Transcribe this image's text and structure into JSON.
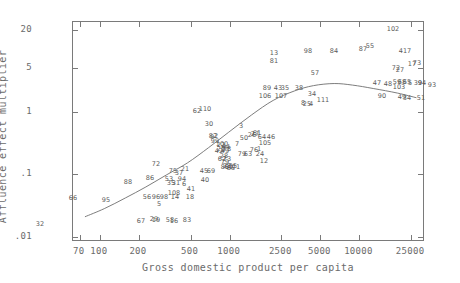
{
  "axes": {
    "x_title": "Gross domestic product per capita",
    "y_title": "Affluence effect multiplier",
    "x_ticks": [
      {
        "label": "70",
        "value": 70
      },
      {
        "label": "100",
        "value": 100
      },
      {
        "label": "200",
        "value": 200
      },
      {
        "label": "500",
        "value": 500
      },
      {
        "label": "1000",
        "value": 1000
      },
      {
        "label": "2500",
        "value": 2500
      },
      {
        "label": "5000",
        "value": 5000
      },
      {
        "label": "10000",
        "value": 10000
      },
      {
        "label": "25000",
        "value": 25000
      }
    ],
    "y_ticks": [
      {
        "label": "20",
        "value": 20
      },
      {
        "label": "5",
        "value": 5
      },
      {
        "label": "1",
        "value": 1
      },
      {
        "label": ".1",
        "value": 0.1
      },
      {
        "label": ".01",
        "value": 0.01
      }
    ]
  },
  "chart_data": {
    "type": "scatter",
    "title": "",
    "xlabel": "Gross domestic product per capita",
    "ylabel": "Affluence effect multiplier",
    "xscale": "log",
    "yscale": "log",
    "xlim": [
      62,
      32000
    ],
    "ylim": [
      0.0082,
      27
    ],
    "grid": false,
    "legend": null,
    "point_label_mode": "numeric-id",
    "annotations": [
      {
        "label": "fitted-curve",
        "type": "smooth-trend-line"
      }
    ],
    "points": [
      {
        "label": "32",
        "x": 112,
        "y": 0.0245
      },
      {
        "label": "66",
        "x": 88,
        "y": 0.041
      },
      {
        "label": "95",
        "x": 130,
        "y": 0.039
      },
      {
        "label": "67",
        "x": 196,
        "y": 0.0265
      },
      {
        "label": "56",
        "x": 212,
        "y": 0.0455
      },
      {
        "label": "96",
        "x": 222,
        "y": 0.0455
      },
      {
        "label": "98",
        "x": 232,
        "y": 0.0455
      },
      {
        "label": "5",
        "x": 228,
        "y": 0.0395
      },
      {
        "label": "19",
        "x": 222,
        "y": 0.0272
      },
      {
        "label": "29",
        "x": 218,
        "y": 0.0277
      },
      {
        "label": "88",
        "x": 268,
        "y": 0.088
      },
      {
        "label": "108",
        "x": 318,
        "y": 0.057
      },
      {
        "label": "14",
        "x": 320,
        "y": 0.0455
      },
      {
        "label": "18",
        "x": 360,
        "y": 0.0455
      },
      {
        "label": "58",
        "x": 314,
        "y": 0.0268
      },
      {
        "label": "16",
        "x": 322,
        "y": 0.0262
      },
      {
        "label": "83",
        "x": 352,
        "y": 0.0278
      },
      {
        "label": "86",
        "x": 310,
        "y": 0.105
      },
      {
        "label": "53",
        "x": 356,
        "y": 0.1
      },
      {
        "label": "35",
        "x": 364,
        "y": 0.086
      },
      {
        "label": "31",
        "x": 372,
        "y": 0.086
      },
      {
        "label": "94",
        "x": 388,
        "y": 0.1
      },
      {
        "label": "6",
        "x": 392,
        "y": 0.082
      },
      {
        "label": "41",
        "x": 404,
        "y": 0.068
      },
      {
        "label": "40",
        "x": 452,
        "y": 0.098
      },
      {
        "label": "75",
        "x": 368,
        "y": 0.13
      },
      {
        "label": "37",
        "x": 384,
        "y": 0.122
      },
      {
        "label": "21",
        "x": 404,
        "y": 0.138
      },
      {
        "label": "72",
        "x": 318,
        "y": 0.165
      },
      {
        "label": "45",
        "x": 472,
        "y": 0.128
      },
      {
        "label": "69",
        "x": 492,
        "y": 0.127
      },
      {
        "label": "89",
        "x": 560,
        "y": 0.146
      },
      {
        "label": "60",
        "x": 574,
        "y": 0.146
      },
      {
        "label": "23",
        "x": 568,
        "y": 0.15
      },
      {
        "label": "55",
        "x": 600,
        "y": 0.15
      },
      {
        "label": "71",
        "x": 612,
        "y": 0.146
      },
      {
        "label": "85",
        "x": 588,
        "y": 0.144
      },
      {
        "label": "28",
        "x": 556,
        "y": 0.213
      },
      {
        "label": "62",
        "x": 548,
        "y": 0.198
      },
      {
        "label": "73",
        "x": 566,
        "y": 0.196
      },
      {
        "label": "79",
        "x": 558,
        "y": 0.178
      },
      {
        "label": "20",
        "x": 540,
        "y": 0.268
      },
      {
        "label": "78",
        "x": 564,
        "y": 0.268
      },
      {
        "label": "42",
        "x": 534,
        "y": 0.254
      },
      {
        "label": "49",
        "x": 552,
        "y": 0.252
      },
      {
        "label": "99",
        "x": 512,
        "y": 0.348
      },
      {
        "label": "100",
        "x": 534,
        "y": 0.322
      },
      {
        "label": "22",
        "x": 530,
        "y": 0.316
      },
      {
        "label": "44",
        "x": 548,
        "y": 0.3
      },
      {
        "label": "9",
        "x": 500,
        "y": 0.395
      },
      {
        "label": "82",
        "x": 504,
        "y": 0.408
      },
      {
        "label": "2",
        "x": 512,
        "y": 0.405
      },
      {
        "label": "30",
        "x": 478,
        "y": 0.6
      },
      {
        "label": "62b",
        "x": 430,
        "y": 0.86
      },
      {
        "label": "110",
        "x": 462,
        "y": 0.92
      },
      {
        "label": "7",
        "x": 612,
        "y": 0.322
      },
      {
        "label": "50",
        "x": 644,
        "y": 0.39
      },
      {
        "label": "26",
        "x": 680,
        "y": 0.418
      },
      {
        "label": "27",
        "x": 700,
        "y": 0.43
      },
      {
        "label": "61",
        "x": 708,
        "y": 0.448
      },
      {
        "label": "64",
        "x": 726,
        "y": 0.398
      },
      {
        "label": "46",
        "x": 772,
        "y": 0.398
      },
      {
        "label": "3",
        "x": 640,
        "y": 0.62
      },
      {
        "label": "105",
        "x": 748,
        "y": 0.318
      },
      {
        "label": "76",
        "x": 690,
        "y": 0.252
      },
      {
        "label": "1",
        "x": 712,
        "y": 0.262
      },
      {
        "label": "63",
        "x": 660,
        "y": 0.222
      },
      {
        "label": "79b",
        "x": 644,
        "y": 0.222
      },
      {
        "label": "24",
        "x": 716,
        "y": 0.222
      },
      {
        "label": "12",
        "x": 730,
        "y": 0.172
      },
      {
        "label": "106",
        "x": 880,
        "y": 1.62
      },
      {
        "label": "107",
        "x": 1010,
        "y": 1.6
      },
      {
        "label": "89b",
        "x": 900,
        "y": 1.95
      },
      {
        "label": "43",
        "x": 985,
        "y": 1.95
      },
      {
        "label": "35b",
        "x": 1040,
        "y": 1.98
      },
      {
        "label": "13",
        "x": 1000,
        "y": 4.4
      },
      {
        "label": "81",
        "x": 1000,
        "y": 3.6
      },
      {
        "label": "98b",
        "x": 1500,
        "y": 4.7
      },
      {
        "label": "38",
        "x": 1300,
        "y": 1.98
      },
      {
        "label": "8",
        "x": 1420,
        "y": 1.28
      },
      {
        "label": "25",
        "x": 1450,
        "y": 1.26
      },
      {
        "label": "4",
        "x": 1480,
        "y": 1.26
      },
      {
        "label": "111",
        "x": 1640,
        "y": 1.42
      },
      {
        "label": "34",
        "x": 1510,
        "y": 1.75
      },
      {
        "label": "57",
        "x": 1560,
        "y": 2.52
      },
      {
        "label": "84",
        "x": 1900,
        "y": 4.5
      },
      {
        "label": "47",
        "x": 3300,
        "y": 2.05
      },
      {
        "label": "48",
        "x": 3700,
        "y": 1.98
      },
      {
        "label": "87",
        "x": 3900,
        "y": 4.5
      },
      {
        "label": "55b",
        "x": 4150,
        "y": 5.3
      },
      {
        "label": "90",
        "x": 4100,
        "y": 1.0
      },
      {
        "label": "103",
        "x": 4500,
        "y": 1.72
      },
      {
        "label": "68",
        "x": 4600,
        "y": 2.0
      },
      {
        "label": "59",
        "x": 4450,
        "y": 2.02
      },
      {
        "label": "65",
        "x": 4750,
        "y": 2.0
      },
      {
        "label": "72b",
        "x": 5400,
        "y": 2.62
      },
      {
        "label": "27b",
        "x": 5600,
        "y": 2.55
      },
      {
        "label": "4b",
        "x": 6100,
        "y": 1.9
      },
      {
        "label": "417",
        "x": 6200,
        "y": 4.55
      },
      {
        "label": "17",
        "x": 6400,
        "y": 2.78
      },
      {
        "label": "3b",
        "x": 6700,
        "y": 2.8
      },
      {
        "label": "39",
        "x": 7600,
        "y": 1.92
      },
      {
        "label": "84b",
        "x": 7800,
        "y": 1.95
      },
      {
        "label": "49b",
        "x": 7900,
        "y": 1.02
      },
      {
        "label": "34b",
        "x": 8600,
        "y": 0.98
      },
      {
        "label": "51",
        "x": 11500,
        "y": 0.98
      },
      {
        "label": "93",
        "x": 13500,
        "y": 1.7
      },
      {
        "label": "102",
        "x": 13000,
        "y": 16.5
      }
    ]
  },
  "point_labels": [
    {
      "t": "32",
      "x": 39,
      "y": 223
    },
    {
      "t": "66",
      "x": 72,
      "y": 197
    },
    {
      "t": "95",
      "x": 105,
      "y": 199
    },
    {
      "t": "67",
      "x": 140,
      "y": 220
    },
    {
      "t": "56",
      "x": 146,
      "y": 196
    },
    {
      "t": "96",
      "x": 155,
      "y": 196
    },
    {
      "t": "98",
      "x": 163,
      "y": 196
    },
    {
      "t": "5",
      "x": 158,
      "y": 203
    },
    {
      "t": "19",
      "x": 155,
      "y": 219
    },
    {
      "t": "29",
      "x": 153,
      "y": 218
    },
    {
      "t": "88",
      "x": 127,
      "y": 181
    },
    {
      "t": "108",
      "x": 173,
      "y": 192
    },
    {
      "t": "14",
      "x": 174,
      "y": 196
    },
    {
      "t": "18",
      "x": 189,
      "y": 196
    },
    {
      "t": "58",
      "x": 169,
      "y": 219
    },
    {
      "t": "16",
      "x": 173,
      "y": 220
    },
    {
      "t": "83",
      "x": 186,
      "y": 219
    },
    {
      "t": "86",
      "x": 149,
      "y": 177
    },
    {
      "t": "53",
      "x": 168,
      "y": 178
    },
    {
      "t": "35",
      "x": 170,
      "y": 182
    },
    {
      "t": "31",
      "x": 175,
      "y": 182
    },
    {
      "t": "94",
      "x": 181,
      "y": 178
    },
    {
      "t": "6",
      "x": 183,
      "y": 183
    },
    {
      "t": "41",
      "x": 190,
      "y": 188
    },
    {
      "t": "40",
      "x": 204,
      "y": 179
    },
    {
      "t": "75",
      "x": 172,
      "y": 170
    },
    {
      "t": "37",
      "x": 178,
      "y": 172
    },
    {
      "t": "21",
      "x": 184,
      "y": 168
    },
    {
      "t": "72",
      "x": 155,
      "y": 163
    },
    {
      "t": "45",
      "x": 203,
      "y": 170
    },
    {
      "t": "69",
      "x": 210,
      "y": 170
    },
    {
      "t": "89",
      "x": 224,
      "y": 166
    },
    {
      "t": "60",
      "x": 228,
      "y": 166
    },
    {
      "t": "23",
      "x": 226,
      "y": 165
    },
    {
      "t": "55",
      "x": 232,
      "y": 165
    },
    {
      "t": "71",
      "x": 235,
      "y": 166
    },
    {
      "t": "85",
      "x": 230,
      "y": 167
    },
    {
      "t": "28",
      "x": 223,
      "y": 155
    },
    {
      "t": "62",
      "x": 221,
      "y": 158
    },
    {
      "t": "73",
      "x": 226,
      "y": 158
    },
    {
      "t": "79",
      "x": 224,
      "y": 161
    },
    {
      "t": "20",
      "x": 220,
      "y": 148
    },
    {
      "t": "78",
      "x": 226,
      "y": 148
    },
    {
      "t": "42",
      "x": 218,
      "y": 150
    },
    {
      "t": "49",
      "x": 224,
      "y": 150
    },
    {
      "t": "99",
      "x": 214,
      "y": 140
    },
    {
      "t": "100",
      "x": 221,
      "y": 143
    },
    {
      "t": "22",
      "x": 220,
      "y": 144
    },
    {
      "t": "44",
      "x": 225,
      "y": 146
    },
    {
      "t": "9",
      "x": 211,
      "y": 136
    },
    {
      "t": "82",
      "x": 212,
      "y": 135
    },
    {
      "t": "2",
      "x": 215,
      "y": 135
    },
    {
      "t": "30",
      "x": 208,
      "y": 123
    },
    {
      "t": "62",
      "x": 196,
      "y": 110
    },
    {
      "t": "110",
      "x": 204,
      "y": 108
    },
    {
      "t": "7",
      "x": 236,
      "y": 143
    },
    {
      "t": "50",
      "x": 243,
      "y": 137
    },
    {
      "t": "26",
      "x": 251,
      "y": 134
    },
    {
      "t": "27",
      "x": 254,
      "y": 133
    },
    {
      "t": "61",
      "x": 256,
      "y": 132
    },
    {
      "t": "64",
      "x": 261,
      "y": 136
    },
    {
      "t": "46",
      "x": 270,
      "y": 136
    },
    {
      "t": "3",
      "x": 240,
      "y": 125
    },
    {
      "t": "105",
      "x": 264,
      "y": 142
    },
    {
      "t": "76",
      "x": 253,
      "y": 149
    },
    {
      "t": "1",
      "x": 258,
      "y": 148
    },
    {
      "t": "63",
      "x": 247,
      "y": 153
    },
    {
      "t": "79",
      "x": 241,
      "y": 153
    },
    {
      "t": "24",
      "x": 259,
      "y": 153
    },
    {
      "t": "12",
      "x": 263,
      "y": 160
    },
    {
      "t": "106",
      "x": 264,
      "y": 95
    },
    {
      "t": "107",
      "x": 280,
      "y": 95
    },
    {
      "t": "89",
      "x": 266,
      "y": 87
    },
    {
      "t": "43",
      "x": 277,
      "y": 87
    },
    {
      "t": "35",
      "x": 284,
      "y": 87
    },
    {
      "t": "13",
      "x": 273,
      "y": 52
    },
    {
      "t": "81",
      "x": 273,
      "y": 60
    },
    {
      "t": "98",
      "x": 307,
      "y": 50
    },
    {
      "t": "38",
      "x": 298,
      "y": 87
    },
    {
      "t": "8",
      "x": 302,
      "y": 102
    },
    {
      "t": "25",
      "x": 306,
      "y": 103
    },
    {
      "t": "4",
      "x": 310,
      "y": 103
    },
    {
      "t": "111",
      "x": 322,
      "y": 99
    },
    {
      "t": "34",
      "x": 311,
      "y": 93
    },
    {
      "t": "57",
      "x": 314,
      "y": 72
    },
    {
      "t": "84",
      "x": 333,
      "y": 50
    },
    {
      "t": "47",
      "x": 376,
      "y": 82
    },
    {
      "t": "48",
      "x": 387,
      "y": 83
    },
    {
      "t": "87",
      "x": 362,
      "y": 48
    },
    {
      "t": "55",
      "x": 369,
      "y": 45
    },
    {
      "t": "90",
      "x": 381,
      "y": 95
    },
    {
      "t": "103",
      "x": 398,
      "y": 86
    },
    {
      "t": "68",
      "x": 401,
      "y": 81
    },
    {
      "t": "59",
      "x": 396,
      "y": 81
    },
    {
      "t": "65",
      "x": 406,
      "y": 81
    },
    {
      "t": "72",
      "x": 395,
      "y": 67
    },
    {
      "t": "27",
      "x": 399,
      "y": 69
    },
    {
      "t": "5",
      "x": 409,
      "y": 82
    },
    {
      "t": "417",
      "x": 404,
      "y": 50
    },
    {
      "t": "17",
      "x": 411,
      "y": 63
    },
    {
      "t": "73",
      "x": 416,
      "y": 62
    },
    {
      "t": "39",
      "x": 417,
      "y": 82
    },
    {
      "t": "94",
      "x": 421,
      "y": 82
    },
    {
      "t": "49",
      "x": 401,
      "y": 96
    },
    {
      "t": "34",
      "x": 406,
      "y": 97
    },
    {
      "t": "51",
      "x": 420,
      "y": 97
    },
    {
      "t": "93",
      "x": 431,
      "y": 84
    },
    {
      "t": "102",
      "x": 392,
      "y": 28
    }
  ]
}
